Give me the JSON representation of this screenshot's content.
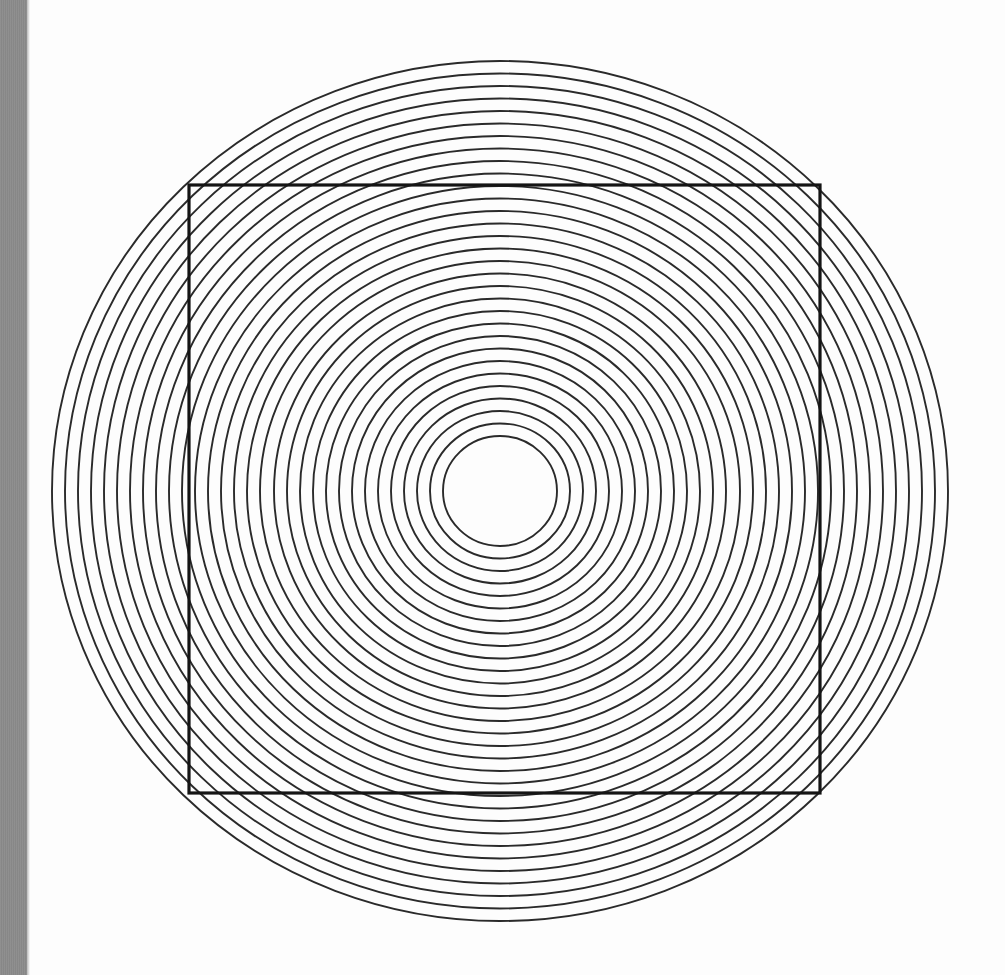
{
  "page": {
    "width": 1005,
    "height": 975,
    "background_color": "#fdfdfd"
  },
  "gutter": {
    "label": "left margin band",
    "color": "#8b8b8b",
    "x": 0,
    "y": 0,
    "width": 27,
    "height": 975
  },
  "figure": {
    "stroke_color": "#2a2a2a",
    "circle_stroke_width": 1.9,
    "square_stroke_color": "#141414",
    "square_stroke_width": 3.2,
    "fill": "none"
  },
  "chart_data": {
    "type": "scatter",
    "subtitle": "",
    "xlabel": "",
    "ylabel": "",
    "grid": false,
    "legend_position": "none",
    "xlim": [
      0,
      1005
    ],
    "ylim": [
      0,
      975
    ],
    "center": {
      "x": 500,
      "y": 491
    },
    "rings": {
      "count": 31,
      "innermost_rx": 57,
      "innermost_ry": 55,
      "outermost_rx": 448,
      "outermost_ry": 430,
      "radius_step_x": 13.03,
      "radius_step_y": 12.5,
      "radii_x": [
        57,
        70,
        83,
        96,
        109,
        122,
        135,
        148,
        161,
        174,
        187,
        200,
        213,
        226,
        240,
        253,
        266,
        279,
        292,
        305,
        318,
        331,
        344,
        357,
        370,
        383,
        396,
        409,
        422,
        435,
        448
      ],
      "radii_y": [
        55,
        67.5,
        80,
        92.5,
        105,
        117.5,
        130,
        142.5,
        155,
        167.5,
        180,
        192.5,
        205,
        217.5,
        230,
        242.5,
        255,
        267.5,
        280,
        292.5,
        305,
        317.5,
        330,
        342.5,
        355,
        367.5,
        380,
        392.5,
        405,
        417.5,
        430
      ]
    },
    "square": {
      "x": 189,
      "y": 185,
      "width": 631,
      "height": 608,
      "left": 189,
      "top": 185,
      "right": 820,
      "bottom": 793
    }
  }
}
